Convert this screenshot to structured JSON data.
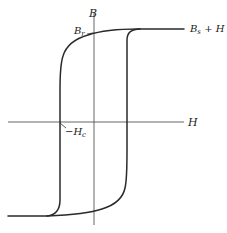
{
  "diagram": {
    "type": "hysteresis-loop",
    "labels": {
      "y_axis": "B",
      "x_axis": "H",
      "remanence": "B",
      "remanence_sub": "r",
      "coercivity_prefix": "−H",
      "coercivity_sub": "c",
      "saturation": "B",
      "saturation_sub": "s",
      "saturation_suffix": " + H"
    },
    "colors": {
      "curve": "#2a2a2a",
      "axis": "#555555",
      "background": "#ffffff"
    }
  }
}
